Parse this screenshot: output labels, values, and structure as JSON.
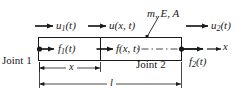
{
  "figure": {
    "colors": {
      "stroke": "#1a1a1a",
      "text": "#1a1a1a",
      "background": "#ffffff"
    },
    "labels": {
      "material_props": "m, E, A",
      "u1": "u",
      "u1_sub": "1",
      "u1_arg": "(t)",
      "ux": "u",
      "ux_arg": "(x, t)",
      "u2": "u",
      "u2_sub": "2",
      "u2_arg": "(t)",
      "f1": "f",
      "f1_sub": "1",
      "f1_arg": "(t)",
      "fx": "f",
      "fx_arg": "(x, t)",
      "f2": "f",
      "f2_sub": "2",
      "f2_arg": "(t)",
      "joint1": "Joint 1",
      "joint2": "Joint 2",
      "axis_x": "x",
      "dim_x": "x",
      "dim_l": "l"
    }
  }
}
